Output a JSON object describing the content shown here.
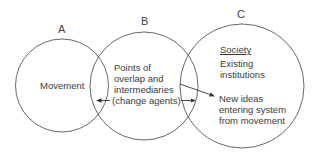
{
  "diagram": {
    "circles": [
      {
        "id": "A",
        "label": "A",
        "text": [
          "Movement"
        ]
      },
      {
        "id": "B",
        "label": "B",
        "text": [
          "Points of",
          "overlap and",
          "intermediaries",
          "(change agents)"
        ]
      },
      {
        "id": "C",
        "label": "C",
        "heading": "Society",
        "text": [
          "Existing",
          "institutions"
        ],
        "text2": [
          "New ideas",
          "entering system",
          "from movement"
        ]
      }
    ],
    "arrows": [
      {
        "from": "B",
        "to": "A-B overlap",
        "direction": "left"
      },
      {
        "from": "B",
        "to": "B-C overlap",
        "direction": "right"
      },
      {
        "from": "B",
        "to": "C new ideas",
        "direction": "diagonal"
      }
    ],
    "stroke_color": "#555555"
  }
}
